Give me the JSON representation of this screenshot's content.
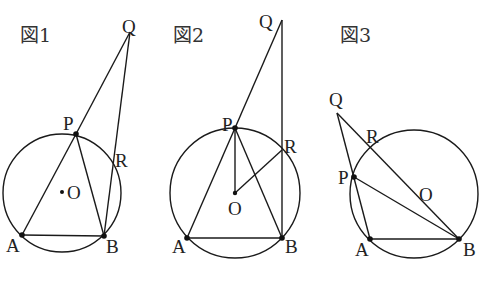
{
  "figures": [
    {
      "caption": "図1",
      "labels": {
        "P": "P",
        "Q": "Q",
        "R": "R",
        "O": "O",
        "A": "A",
        "B": "B"
      }
    },
    {
      "caption": "図2",
      "labels": {
        "P": "P",
        "Q": "Q",
        "R": "R",
        "O": "O",
        "A": "A",
        "B": "B"
      }
    },
    {
      "caption": "図3",
      "labels": {
        "P": "P",
        "Q": "Q",
        "R": "R",
        "O": "O",
        "A": "A",
        "B": "B"
      }
    }
  ],
  "colors": {
    "stroke": "#1a1a1a",
    "background": "#ffffff"
  }
}
